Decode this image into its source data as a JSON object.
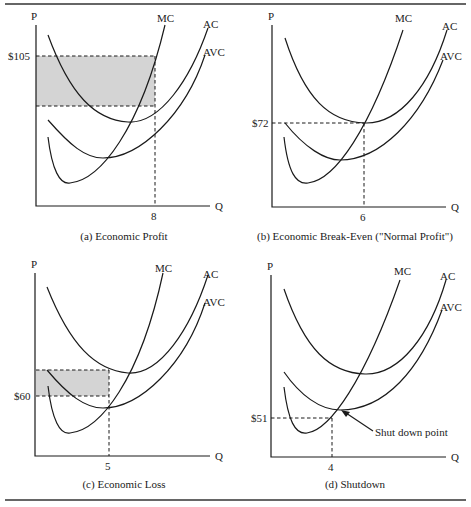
{
  "figure": {
    "panels": [
      {
        "id": "a",
        "caption": "(a) Economic Profit",
        "y_label": "P",
        "x_label": "Q",
        "curves": [
          "MC",
          "AC",
          "AVC"
        ],
        "price_label": "$105",
        "quantity_label": "8",
        "shaded_region": "economic profit"
      },
      {
        "id": "b",
        "caption": "(b) Economic Break-Even (\"Normal Profit\")",
        "y_label": "P",
        "x_label": "Q",
        "curves": [
          "MC",
          "AC",
          "AVC"
        ],
        "price_label": "$72",
        "quantity_label": "6"
      },
      {
        "id": "c",
        "caption": "(c) Economic Loss",
        "y_label": "P",
        "x_label": "Q",
        "curves": [
          "MC",
          "AC",
          "AVC"
        ],
        "price_label": "$60",
        "quantity_label": "5",
        "shaded_region": "economic loss"
      },
      {
        "id": "d",
        "caption": "(d) Shutdown",
        "y_label": "P",
        "x_label": "Q",
        "curves": [
          "MC",
          "AC",
          "AVC"
        ],
        "price_label": "$51",
        "quantity_label": "4",
        "annotation": "Shut down point"
      }
    ]
  },
  "colors": {
    "line": "#1a1a1a",
    "shade": "#d4d4d4"
  }
}
